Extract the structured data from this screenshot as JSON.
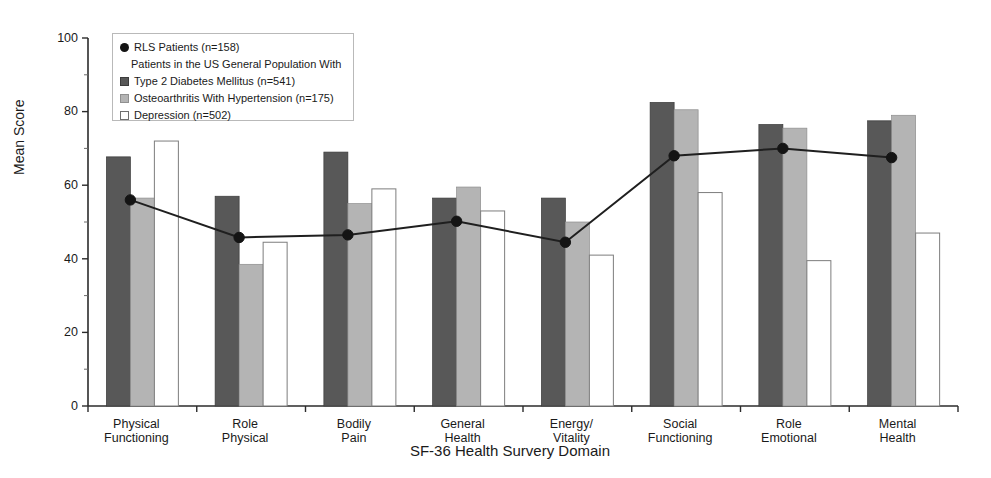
{
  "chart_data": {
    "type": "bar",
    "title": "",
    "xlabel": "SF-36 Health Survery Domain",
    "ylabel": "Mean Score",
    "ylim": [
      0,
      100
    ],
    "yticks": [
      0,
      20,
      40,
      60,
      80,
      100
    ],
    "ytick_labels": [
      "0",
      "20",
      "40",
      "60",
      "80",
      "100"
    ],
    "grid": false,
    "legend_position": "upper-left",
    "categories": [
      "Physical\nFunctioning",
      "Role\nPhysical",
      "Bodily\nPain",
      "General\nHealth",
      "Energy/\nVitality",
      "Social\nFunctioning",
      "Role\nEmotional",
      "Mental\nHealth"
    ],
    "category_lines": [
      [
        "Physical",
        "Functioning"
      ],
      [
        "Role",
        "Physical"
      ],
      [
        "Bodily",
        "Pain"
      ],
      [
        "General",
        "Health"
      ],
      [
        "Energy/",
        "Vitality"
      ],
      [
        "Social",
        "Functioning"
      ],
      [
        "Role",
        "Emotional"
      ],
      [
        "Mental",
        "Health"
      ]
    ],
    "series": [
      {
        "name": "Type 2 Diabetes Mellitus (n=541)",
        "key": "diabetes",
        "render": "bar",
        "color": "#585858",
        "values": [
          67.7,
          57.0,
          69.0,
          56.5,
          56.5,
          82.5,
          76.5,
          77.5
        ]
      },
      {
        "name": "Osteoarthritis With Hypertension (n=175)",
        "key": "osteoarthritis",
        "render": "bar",
        "color": "#b4b4b4",
        "values": [
          56.5,
          38.5,
          55.0,
          59.5,
          50.0,
          80.5,
          75.5,
          79.0
        ]
      },
      {
        "name": "Depression (n=502)",
        "key": "depression",
        "render": "bar",
        "color": "#ffffff",
        "values": [
          72.0,
          44.5,
          59.0,
          53.0,
          41.0,
          58.0,
          39.5,
          47.0
        ]
      },
      {
        "name": "RLS Patients (n=158)",
        "key": "rls",
        "render": "line",
        "color": "#141414",
        "values": [
          56.0,
          45.8,
          46.5,
          50.2,
          44.5,
          68.0,
          70.0,
          67.5
        ]
      }
    ]
  },
  "legend": {
    "rows": [
      {
        "marker": "dot",
        "label": "RLS Patients (n=158)"
      },
      {
        "marker": "none",
        "label": "Patients in the US General Population With"
      },
      {
        "marker": "dark",
        "label": "Type 2 Diabetes Mellitus (n=541)"
      },
      {
        "marker": "gray",
        "label": "Osteoarthritis With Hypertension (n=175)"
      },
      {
        "marker": "white",
        "label": "Depression (n=502)"
      }
    ]
  },
  "axes": {
    "y_title": "Mean Score",
    "x_title": "SF-36 Health Survery Domain"
  }
}
